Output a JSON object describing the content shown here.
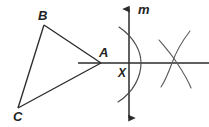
{
  "figure": {
    "kind": "geometry-construction",
    "canvas": {
      "width": 209,
      "height": 127,
      "background": "#ffffff"
    },
    "stroke": {
      "color": "#2b2b2b",
      "light_color": "#6b6b6b",
      "width": 1.3,
      "arc_width": 1.1
    }
  },
  "labels": {
    "vertex_b": "B",
    "vertex_c": "C",
    "vertex_a": "A",
    "point_x": "X",
    "line_m": "m"
  },
  "points": {
    "A": {
      "x": 101,
      "y": 63
    },
    "B": {
      "x": 44,
      "y": 25
    },
    "C": {
      "x": 18,
      "y": 108
    },
    "X": {
      "x": 129,
      "y": 63
    },
    "right_arc_intersection": {
      "x": 176,
      "y": 63
    }
  },
  "label_positions": {
    "vertex_b": {
      "x": 38,
      "y": 9
    },
    "vertex_c": {
      "x": 13,
      "y": 111
    },
    "vertex_a": {
      "x": 99,
      "y": 47
    },
    "point_x": {
      "x": 118,
      "y": 68
    },
    "line_m": {
      "x": 138,
      "y": 4
    }
  },
  "elements": {
    "triangle_sides": [
      "AB",
      "BC",
      "CA"
    ],
    "horizontal_line": {
      "from_x": 78,
      "to_x": 209,
      "y": 63,
      "label": ""
    },
    "vertical_line": {
      "x": 129,
      "from_y": 4,
      "to_y": 123,
      "label": "m",
      "arrows": "both"
    },
    "arcs": [
      {
        "name": "arc-centered-at-A",
        "description": "large arc bulging right, crossing line m above and below"
      },
      {
        "name": "arc-upper-right",
        "description": "arc crossing the horizontal line from upper-right"
      },
      {
        "name": "arc-lower-right",
        "description": "arc crossing the horizontal line from lower-right"
      }
    ]
  }
}
